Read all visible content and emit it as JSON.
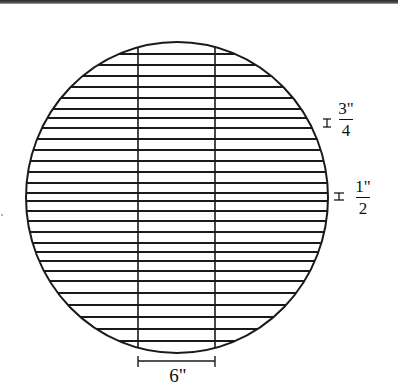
{
  "diagram": {
    "title": "",
    "shape": "circle",
    "stroke_color": "#1a1a1a",
    "background": "#ffffff",
    "circle": {
      "cx": 177,
      "cy": 197.5,
      "rx": 151,
      "ry": 155.5
    },
    "vertical_supports_x": [
      138,
      215
    ],
    "horizontal_bars_y": [
      54,
      65,
      76,
      87,
      98,
      109,
      118,
      128,
      139,
      150,
      161,
      172,
      183,
      193,
      201,
      211,
      221,
      232,
      243,
      252,
      261,
      271,
      281,
      293,
      305,
      317,
      329,
      341
    ],
    "annotations": {
      "spacing_top": {
        "numerator": "3\"",
        "denominator": "4",
        "label": "3/4 inch spacing"
      },
      "spacing_middle": {
        "numerator": "1\"",
        "denominator": "2",
        "label": "1/2 inch spacing"
      },
      "support_width": {
        "label": "6\""
      }
    }
  }
}
